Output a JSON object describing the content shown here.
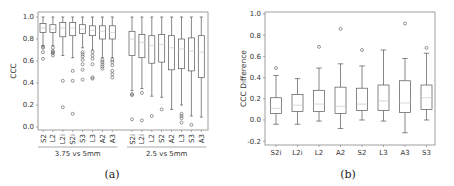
{
  "chart_data": [
    {
      "id": "a",
      "type": "box",
      "caption": "(a)",
      "ylabel": "CCC",
      "ylim": [
        -0.02,
        1.03
      ],
      "yticks": [
        0.0,
        0.2,
        0.4,
        0.6,
        0.8,
        1.0
      ],
      "ytick_labels": [
        "0.0",
        "0.2",
        "0.4",
        "0.6",
        "0.8",
        "1.0"
      ],
      "groups": [
        {
          "label": "3.75 vs 5mm",
          "categories": [
            "S2",
            "L2",
            "L2i",
            "S2i",
            "S3",
            "L3",
            "A2",
            "A3"
          ],
          "boxes": [
            {
              "lo": 0.74,
              "q1": 0.86,
              "med": 0.9,
              "q3": 0.94,
              "hi": 1.0,
              "outliers": [
                0.72,
                0.73,
                0.68,
                0.62
              ]
            },
            {
              "lo": 0.74,
              "q1": 0.86,
              "med": 0.89,
              "q3": 0.93,
              "hi": 1.0,
              "outliers": [
                0.72,
                0.69,
                0.68,
                0.67,
                0.65
              ]
            },
            {
              "lo": 0.65,
              "q1": 0.82,
              "med": 0.9,
              "q3": 0.95,
              "hi": 1.0,
              "outliers": [
                0.42,
                0.18
              ]
            },
            {
              "lo": 0.63,
              "q1": 0.83,
              "med": 0.9,
              "q3": 0.95,
              "hi": 1.0,
              "outliers": [
                0.51,
                0.42,
                0.12
              ]
            },
            {
              "lo": 0.72,
              "q1": 0.85,
              "med": 0.89,
              "q3": 0.93,
              "hi": 1.0,
              "outliers": [
                0.68,
                0.66,
                0.64,
                0.61,
                0.57,
                0.52,
                0.43
              ]
            },
            {
              "lo": 0.7,
              "q1": 0.83,
              "med": 0.88,
              "q3": 0.92,
              "hi": 1.0,
              "outliers": [
                0.68,
                0.65,
                0.62,
                0.57,
                0.45,
                0.44
              ]
            },
            {
              "lo": 0.63,
              "q1": 0.8,
              "med": 0.87,
              "q3": 0.92,
              "hi": 1.0,
              "outliers": [
                0.61,
                0.59,
                0.57,
                0.55,
                0.53
              ]
            },
            {
              "lo": 0.63,
              "q1": 0.8,
              "med": 0.86,
              "q3": 0.92,
              "hi": 1.0,
              "outliers": [
                0.61,
                0.59,
                0.56,
                0.51,
                0.48,
                0.45
              ]
            }
          ]
        },
        {
          "label": "2.5 vs 5mm",
          "categories": [
            "S2i",
            "L2i",
            "L2",
            "S2",
            "A2",
            "L3",
            "S3",
            "A3"
          ],
          "boxes": [
            {
              "lo": 0.33,
              "q1": 0.65,
              "med": 0.8,
              "q3": 0.87,
              "hi": 1.0,
              "outliers": [
                0.3,
                0.29,
                0.07
              ]
            },
            {
              "lo": 0.35,
              "q1": 0.63,
              "med": 0.77,
              "q3": 0.84,
              "hi": 1.0,
              "outliers": [
                0.31,
                0.06
              ]
            },
            {
              "lo": 0.28,
              "q1": 0.58,
              "med": 0.74,
              "q3": 0.83,
              "hi": 1.0,
              "outliers": [
                0.1
              ]
            },
            {
              "lo": 0.27,
              "q1": 0.59,
              "med": 0.75,
              "q3": 0.84,
              "hi": 1.0,
              "outliers": [
                0.16
              ]
            },
            {
              "lo": 0.16,
              "q1": 0.52,
              "med": 0.72,
              "q3": 0.83,
              "hi": 1.0,
              "outliers": []
            },
            {
              "lo": 0.2,
              "q1": 0.53,
              "med": 0.71,
              "q3": 0.8,
              "hi": 1.0,
              "outliers": [
                0.12,
                0.1,
                0.08,
                0.04
              ]
            },
            {
              "lo": 0.1,
              "q1": 0.51,
              "med": 0.69,
              "q3": 0.81,
              "hi": 1.0,
              "outliers": [
                0.02
              ]
            },
            {
              "lo": 0.09,
              "q1": 0.45,
              "med": 0.68,
              "q3": 0.83,
              "hi": 1.0,
              "outliers": []
            }
          ]
        }
      ]
    },
    {
      "id": "b",
      "type": "box",
      "caption": "(b)",
      "ylabel": "CCC Difference",
      "ylim": [
        -0.24,
        1.0
      ],
      "yticks": [
        -0.2,
        0.0,
        0.2,
        0.4,
        0.6,
        0.8,
        1.0
      ],
      "ytick_labels": [
        "-0.2",
        "0.0",
        "0.2",
        "0.4",
        "0.6",
        "0.8",
        "1.0"
      ],
      "categories": [
        "S2i",
        "L2i",
        "L2",
        "A2",
        "S2",
        "L3",
        "A3",
        "S3"
      ],
      "boxes": [
        {
          "lo": -0.04,
          "q1": 0.06,
          "med": 0.11,
          "q3": 0.21,
          "hi": 0.42,
          "outliers": [
            0.49
          ]
        },
        {
          "lo": -0.04,
          "q1": 0.08,
          "med": 0.14,
          "q3": 0.24,
          "hi": 0.39,
          "outliers": []
        },
        {
          "lo": -0.01,
          "q1": 0.08,
          "med": 0.15,
          "q3": 0.28,
          "hi": 0.49,
          "outliers": [
            0.69
          ]
        },
        {
          "lo": -0.08,
          "q1": 0.06,
          "med": 0.13,
          "q3": 0.31,
          "hi": 0.53,
          "outliers": [
            0.86
          ]
        },
        {
          "lo": 0.0,
          "q1": 0.09,
          "med": 0.15,
          "q3": 0.3,
          "hi": 0.51,
          "outliers": [
            0.66
          ]
        },
        {
          "lo": -0.01,
          "q1": 0.09,
          "med": 0.18,
          "q3": 0.33,
          "hi": 0.66,
          "outliers": []
        },
        {
          "lo": -0.12,
          "q1": 0.07,
          "med": 0.16,
          "q3": 0.37,
          "hi": 0.58,
          "outliers": [
            0.91
          ]
        },
        {
          "lo": 0.0,
          "q1": 0.1,
          "med": 0.21,
          "q3": 0.33,
          "hi": 0.63,
          "outliers": [
            0.68
          ]
        }
      ]
    }
  ],
  "colors": {
    "box": "#555555",
    "median": "#c8c8c8",
    "axis": "#888888",
    "text": "#333333"
  }
}
